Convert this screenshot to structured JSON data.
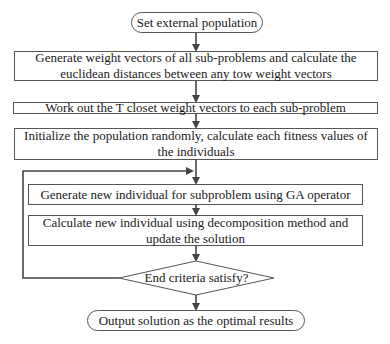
{
  "diagram": {
    "type": "flowchart",
    "nodes": {
      "start": {
        "label": "Set external population",
        "shape": "terminator"
      },
      "step1": {
        "label": "Generate weight vectors of all sub-problems and calculate the euclidean distances between any tow weight vectors",
        "shape": "process"
      },
      "step2": {
        "label": "Work out the T closet weight vectors to each sub-problem",
        "shape": "process"
      },
      "step3": {
        "label": "Initialize the population randomly, calculate each fitness values of the individuals",
        "shape": "process"
      },
      "step4": {
        "label": "Generate new individual for subproblem using GA operator",
        "shape": "process"
      },
      "step5": {
        "label": "Calculate new individual using decomposition method and update the solution",
        "shape": "process"
      },
      "decision": {
        "label": "End criteria satisfy?",
        "shape": "decision"
      },
      "end": {
        "label": "Output solution as the optimal results",
        "shape": "terminator"
      }
    },
    "edges": [
      {
        "from": "start",
        "to": "step1"
      },
      {
        "from": "step1",
        "to": "step2"
      },
      {
        "from": "step2",
        "to": "step3"
      },
      {
        "from": "step3",
        "to": "step4"
      },
      {
        "from": "step4",
        "to": "step5"
      },
      {
        "from": "step5",
        "to": "decision"
      },
      {
        "from": "decision",
        "to": "end",
        "condition": "yes"
      },
      {
        "from": "decision",
        "to": "step4",
        "condition": "no (loop back)"
      }
    ],
    "colors": {
      "line": "#444444",
      "border": "#555555",
      "text": "#1a1a1a",
      "background": "#ffffff"
    }
  }
}
